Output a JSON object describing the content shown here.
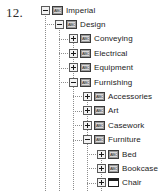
{
  "figure": {
    "number": "12."
  },
  "tree": {
    "root_label": "Imperial",
    "nodes": [
      {
        "label": "Imperial",
        "level": 0,
        "state": "expanded",
        "icon": "folder-abc-icon",
        "expander": "minus"
      },
      {
        "label": "Design",
        "level": 1,
        "state": "expanded",
        "icon": "folder-abc-icon",
        "expander": "minus"
      },
      {
        "label": "Conveying",
        "level": 2,
        "state": "collapsed",
        "icon": "folder-abc-icon",
        "expander": "plus"
      },
      {
        "label": "Electrical",
        "level": 2,
        "state": "collapsed",
        "icon": "folder-abc-icon",
        "expander": "plus"
      },
      {
        "label": "Equipment",
        "level": 2,
        "state": "collapsed",
        "icon": "folder-abc-icon",
        "expander": "plus"
      },
      {
        "label": "Furnishing",
        "level": 2,
        "state": "expanded",
        "icon": "folder-abc-icon",
        "expander": "minus"
      },
      {
        "label": "Accessories",
        "level": 3,
        "state": "collapsed",
        "icon": "folder-abc-icon",
        "expander": "plus"
      },
      {
        "label": "Art",
        "level": 3,
        "state": "collapsed",
        "icon": "folder-abc-icon",
        "expander": "plus"
      },
      {
        "label": "Casework",
        "level": 3,
        "state": "collapsed",
        "icon": "folder-abc-icon",
        "expander": "plus"
      },
      {
        "label": "Furniture",
        "level": 3,
        "state": "expanded",
        "icon": "folder-abc-icon",
        "expander": "minus"
      },
      {
        "label": "Bed",
        "level": 4,
        "state": "collapsed",
        "icon": "folder-abc-icon",
        "expander": "plus"
      },
      {
        "label": "Bookcase",
        "level": 4,
        "state": "collapsed",
        "icon": "folder-abc-icon",
        "expander": "plus"
      },
      {
        "label": "Chair",
        "level": 4,
        "state": "collapsed",
        "icon": "folder-open-icon",
        "expander": "plus"
      },
      {
        "label": "Credenza",
        "level": 4,
        "state": "collapsed",
        "icon": "folder-abc-icon",
        "expander": "plus"
      },
      {
        "label": "Desk",
        "level": 4,
        "state": "collapsed",
        "icon": "folder-abc-icon",
        "expander": "plus"
      },
      {
        "label": "File Cabinet",
        "level": 4,
        "state": "collapsed",
        "icon": "folder-abc-icon",
        "expander": "plus"
      }
    ],
    "icon_text": "ABC"
  },
  "colors": {
    "line": "#8d8d8d",
    "text": "#1b1b1b",
    "icon_fill": "#9a9a9a",
    "icon_inner": "#d9d9d9",
    "icon_border": "#3a3a3a",
    "open_icon_fill": "#ffffff",
    "background": "#ffffff"
  },
  "metrics": {
    "row_height": 14.4,
    "indent": 14,
    "base_left": 41,
    "first_row_top": 3
  }
}
